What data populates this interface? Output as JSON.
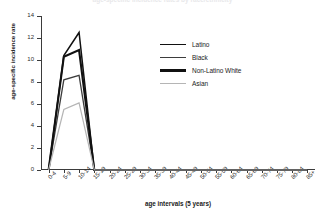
{
  "chart_data": {
    "type": "line",
    "title": "age-specific incidence rates by race/ethnicity",
    "xlabel": "age intervals (5 years)",
    "ylabel": "age-specific incidence rate",
    "ylim": [
      0,
      14
    ],
    "yticks": [
      0,
      2,
      4,
      6,
      8,
      10,
      12,
      14
    ],
    "grid": false,
    "legend_position": "center-right",
    "categories": [
      "0-4",
      "5-9",
      "10-14",
      "15-19",
      "20-24",
      "25-29",
      "30-34",
      "35-39",
      "40-44",
      "45-49",
      "50-54",
      "55-59",
      "60-64",
      "65-69",
      "70-74",
      "75-79",
      "80-84",
      "85+"
    ],
    "series": [
      {
        "name": "Latino",
        "color": "#111111",
        "width": 1.5,
        "values": [
          0,
          10.4,
          12.5,
          0,
          0,
          0,
          0,
          0,
          0,
          0,
          0,
          0,
          0,
          0,
          0,
          0,
          0,
          0
        ]
      },
      {
        "name": "Black",
        "color": "#3d3d3d",
        "width": 1.3,
        "values": [
          0,
          8.2,
          8.6,
          0,
          0,
          0,
          0,
          0,
          0,
          0,
          0,
          0,
          0,
          0,
          0,
          0,
          0,
          0
        ]
      },
      {
        "name": "Non-Latino White",
        "color": "#111111",
        "width": 2.1,
        "values": [
          0,
          10.3,
          10.9,
          0,
          0,
          0,
          0,
          0,
          0,
          0,
          0,
          0,
          0,
          0,
          0,
          0,
          0,
          0
        ]
      },
      {
        "name": "Asian",
        "color": "#b5b5b5",
        "width": 1.2,
        "values": [
          0,
          5.5,
          6.1,
          0,
          0,
          0,
          0,
          0,
          0,
          0,
          0,
          0,
          0,
          0,
          0,
          0,
          0,
          0
        ]
      }
    ]
  }
}
